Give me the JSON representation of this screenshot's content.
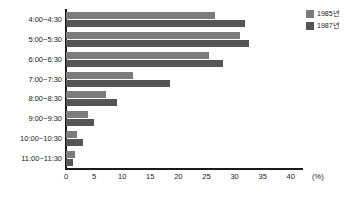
{
  "chart_data": {
    "type": "bar",
    "orientation": "horizontal",
    "title": "",
    "xlabel": "(%)",
    "ylabel": "",
    "xlim": [
      0,
      42
    ],
    "grid": false,
    "legend_position": "top-right",
    "xticks": [
      0,
      5,
      10,
      15,
      20,
      25,
      30,
      35,
      40
    ],
    "unit": "(%)",
    "categories": [
      "4:00~4:30",
      "5:00~5:30",
      "6:00~6:30",
      "7:00~7:30",
      "8:00~8:30",
      "9:00~9:30",
      "10:00~10:30",
      "11:00~11:30"
    ],
    "series": [
      {
        "name": "1985년",
        "color": "#7c7c7c",
        "values": [
          26.5,
          31.0,
          25.5,
          12.0,
          7.2,
          4.0,
          2.0,
          1.6
        ]
      },
      {
        "name": "1987년",
        "color": "#555555",
        "values": [
          31.8,
          32.5,
          28.0,
          18.5,
          9.0,
          5.0,
          3.0,
          1.3
        ]
      }
    ]
  },
  "legend": {
    "items": [
      {
        "label": "1985년",
        "color": "#7c7c7c"
      },
      {
        "label": "1987년",
        "color": "#555555"
      }
    ]
  },
  "colors": {
    "series_1985": "#7c7c7c",
    "series_1987": "#555555",
    "axis": "#1a1a1a",
    "background": "#ffffff"
  }
}
